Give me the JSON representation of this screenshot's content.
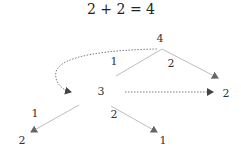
{
  "title": "2 + 2 = 4",
  "colors": {
    "solid_edge": "#bdbdbd",
    "dashed_edge": "#6e6e6e",
    "arrowhead": "#555555",
    "text": "#333333"
  },
  "nodes": [
    {
      "id": "root",
      "label": "4",
      "x": 160,
      "y": 38
    },
    {
      "id": "mid",
      "label": "3",
      "x": 101,
      "y": 91
    },
    {
      "id": "right",
      "label": "2",
      "x": 226,
      "y": 93
    },
    {
      "id": "bottom-left",
      "label": "2",
      "x": 22,
      "y": 140
    },
    {
      "id": "bottom-right",
      "label": "1",
      "x": 163,
      "y": 140
    }
  ],
  "edge_labels": [
    {
      "id": "root-to-mid",
      "label": "1",
      "x": 114,
      "y": 61
    },
    {
      "id": "root-to-right",
      "label": "2",
      "x": 171,
      "y": 63
    },
    {
      "id": "mid-to-bottom-left",
      "label": "1",
      "x": 35,
      "y": 113
    },
    {
      "id": "mid-to-bottom-right",
      "label": "2",
      "x": 114,
      "y": 114
    }
  ],
  "edges": [
    {
      "from": "root",
      "to": "mid",
      "style": "solid",
      "arrow": false
    },
    {
      "from": "root",
      "to": "right",
      "style": "solid",
      "arrow": true
    },
    {
      "from": "mid",
      "to": "bottom-left",
      "style": "solid",
      "arrow": true
    },
    {
      "from": "mid",
      "to": "bottom-right",
      "style": "solid",
      "arrow": true
    },
    {
      "from": "root",
      "to": "mid",
      "style": "dashed-curve",
      "arrow": true
    },
    {
      "from": "mid",
      "to": "right",
      "style": "dashed",
      "arrow": true
    }
  ]
}
